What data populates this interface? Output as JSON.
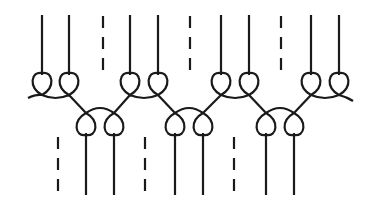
{
  "diagram": {
    "title": "Stitch pattern: looped chain with vertical threads",
    "stroke_color": "#1a1a1a",
    "background": "#ffffff",
    "top_row": {
      "solid_threads_x": [
        42,
        69,
        130,
        158,
        221,
        249,
        311,
        339
      ],
      "dashed_threads_x": [
        103,
        190,
        281
      ],
      "thread_top_y": 15,
      "loop_point_y": 95
    },
    "bottom_row": {
      "solid_threads_x": [
        86,
        114,
        175,
        203,
        266,
        294
      ],
      "dashed_threads_x": [
        58,
        145,
        234
      ],
      "thread_bottom_y": 195,
      "loop_point_y": 113
    }
  }
}
